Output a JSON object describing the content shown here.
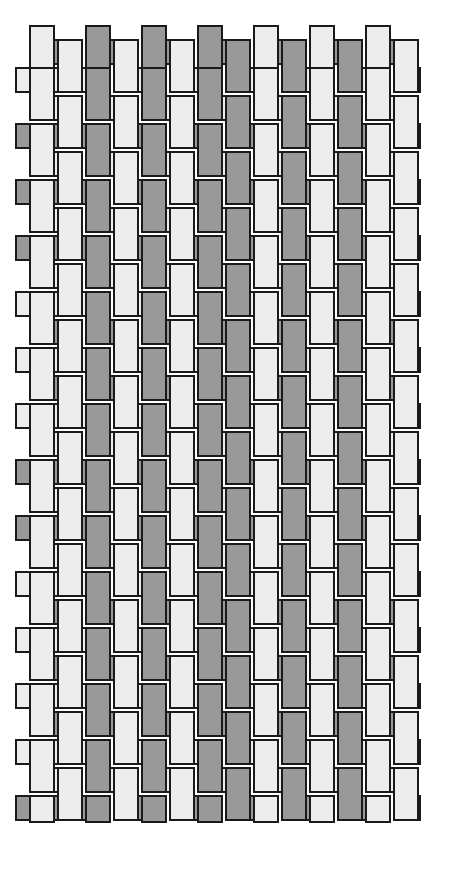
{
  "figure": {
    "title": "Color and W",
    "title_note": "clipped-at-top-edge",
    "type": "plain-weave-tabby-diagram",
    "caption": ""
  },
  "palette": {
    "background": "#ffffff",
    "light_strip": "#ededed",
    "dark_strip": "#999999",
    "outline": "#1a1a1a",
    "title_color": "#3a3a42"
  },
  "geometry": {
    "origin_x": 28,
    "origin_y": 38,
    "pitch": 28,
    "strip_width": 24,
    "strip_length": 52,
    "stroke_width": 2,
    "warp_columns": 14,
    "weft_rows": 28,
    "block_width_px": 400,
    "block_height_px": 795
  },
  "weave": {
    "structure": "plain weave (1/1 tabby), long floats shown as overlapping rectangles",
    "warp_label": "warp (vertical strips)",
    "weft_label": "weft (horizontal strips)",
    "warp_colors": [
      "light",
      "light",
      "dark",
      "light",
      "dark",
      "light",
      "dark",
      "dark",
      "light",
      "dark",
      "light",
      "dark",
      "light",
      "light"
    ],
    "weft_colors": [
      "dark",
      "light",
      "light",
      "dark",
      "light",
      "dark",
      "light",
      "dark",
      "light",
      "light",
      "dark",
      "light",
      "dark",
      "light",
      "light",
      "dark",
      "light",
      "dark",
      "light",
      "light",
      "dark",
      "light",
      "dark",
      "light",
      "dark",
      "light",
      "light",
      "dark"
    ]
  },
  "legend": {
    "items": [
      {
        "swatch": "#ededed",
        "label": "light yarn"
      },
      {
        "swatch": "#999999",
        "label": "dark yarn"
      }
    ],
    "visible": false
  }
}
